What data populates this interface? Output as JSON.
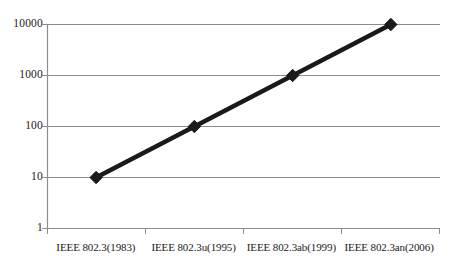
{
  "chart_data": {
    "type": "line",
    "title": "",
    "subtitle": "",
    "xlabel": "",
    "ylabel": "",
    "categories": [
      "IEEE 802.3(1983)",
      "IEEE 802.3u(1995)",
      "IEEE 802.3ab(1999)",
      "IEEE 802.3an(2006)"
    ],
    "series": [
      {
        "name": "Speed",
        "values": [
          10,
          100,
          1000,
          10000
        ]
      }
    ],
    "yscale": "log",
    "ylim": [
      1,
      10000
    ],
    "ytick_labels": [
      "10000",
      "1000",
      "100",
      "10",
      "1"
    ],
    "ytick_values": [
      10000,
      1000,
      100,
      10,
      1
    ],
    "grid": "horizontal",
    "legend": "none",
    "marker": "diamond",
    "colors": {
      "line": "#1a1a1a",
      "marker": "#1a1a1a",
      "grid": "#8c8c8c",
      "axis": "#8c8c8c",
      "text": "#1a1a1a",
      "background": "#ffffff"
    }
  }
}
